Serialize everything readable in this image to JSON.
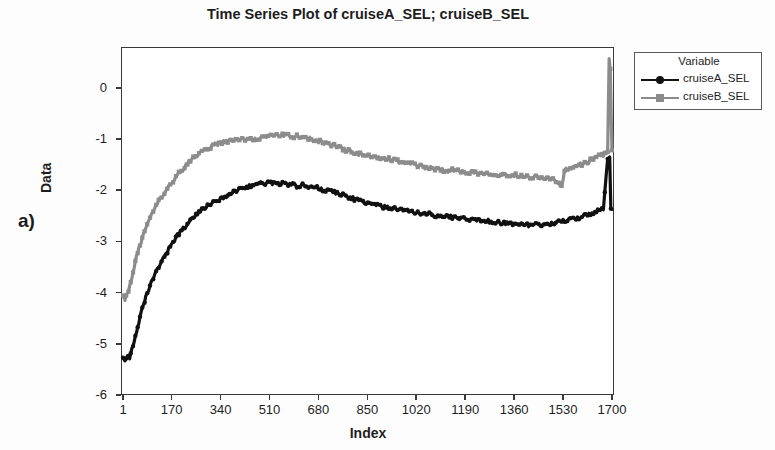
{
  "figure": {
    "panel_label": "a)"
  },
  "chart_data": {
    "type": "line",
    "title": "Time Series Plot of cruiseA_SEL; cruiseB_SEL",
    "xlabel": "Index",
    "ylabel": "Data",
    "xlim": [
      1,
      1700
    ],
    "ylim": [
      -6,
      0.8
    ],
    "grid": false,
    "legend_position": "right-outside",
    "legend_title": "Variable",
    "xticks": [
      1,
      170,
      340,
      510,
      680,
      850,
      1020,
      1190,
      1360,
      1530,
      1700
    ],
    "xtick_labels": [
      "1",
      "170",
      "340",
      "510",
      "680",
      "850",
      "1020",
      "1190",
      "1360",
      "1530",
      "1700"
    ],
    "yticks": [
      0,
      -1,
      -2,
      -3,
      -4,
      -5,
      -6
    ],
    "ytick_labels": [
      "0",
      "-1",
      "-2",
      "-3",
      "-4",
      "-5",
      "-6"
    ],
    "series": [
      {
        "name": "cruiseA_SEL",
        "color": "#111111",
        "marker": "circle",
        "x": [
          1,
          8,
          16,
          24,
          32,
          40,
          48,
          56,
          64,
          72,
          80,
          90,
          100,
          112,
          125,
          140,
          155,
          170,
          190,
          210,
          230,
          250,
          270,
          290,
          310,
          330,
          350,
          370,
          390,
          410,
          430,
          450,
          470,
          490,
          510,
          530,
          550,
          570,
          590,
          610,
          630,
          650,
          670,
          690,
          710,
          730,
          750,
          770,
          790,
          810,
          830,
          850,
          870,
          890,
          910,
          930,
          950,
          970,
          990,
          1010,
          1030,
          1050,
          1070,
          1090,
          1110,
          1130,
          1150,
          1170,
          1190,
          1210,
          1230,
          1250,
          1270,
          1290,
          1310,
          1330,
          1350,
          1370,
          1390,
          1410,
          1430,
          1450,
          1470,
          1490,
          1510,
          1530,
          1550,
          1570,
          1590,
          1610,
          1630,
          1650,
          1670,
          1685,
          1692,
          1696,
          1700
        ],
        "y": [
          -5.25,
          -5.3,
          -5.22,
          -5.26,
          -5.1,
          -4.95,
          -4.8,
          -4.6,
          -4.4,
          -4.25,
          -4.1,
          -3.95,
          -3.8,
          -3.65,
          -3.5,
          -3.35,
          -3.2,
          -3.05,
          -2.88,
          -2.75,
          -2.62,
          -2.5,
          -2.4,
          -2.33,
          -2.26,
          -2.2,
          -2.14,
          -2.08,
          -2.02,
          -1.97,
          -1.93,
          -1.9,
          -1.87,
          -1.86,
          -1.85,
          -1.87,
          -1.86,
          -1.9,
          -1.88,
          -1.92,
          -1.9,
          -1.95,
          -1.94,
          -1.98,
          -2.0,
          -2.03,
          -2.06,
          -2.1,
          -2.14,
          -2.18,
          -2.22,
          -2.26,
          -2.28,
          -2.3,
          -2.33,
          -2.34,
          -2.36,
          -2.38,
          -2.4,
          -2.42,
          -2.45,
          -2.44,
          -2.47,
          -2.5,
          -2.52,
          -2.5,
          -2.53,
          -2.55,
          -2.54,
          -2.57,
          -2.58,
          -2.6,
          -2.59,
          -2.62,
          -2.63,
          -2.64,
          -2.65,
          -2.66,
          -2.67,
          -2.68,
          -2.68,
          -2.67,
          -2.66,
          -2.65,
          -2.63,
          -2.6,
          -2.58,
          -2.55,
          -2.52,
          -2.48,
          -2.44,
          -2.4,
          -2.38,
          -1.35,
          -1.35,
          -2.38,
          -2.37
        ]
      },
      {
        "name": "cruiseB_SEL",
        "color": "#8c8c8c",
        "marker": "square",
        "x": [
          1,
          8,
          16,
          24,
          32,
          40,
          48,
          56,
          64,
          72,
          80,
          90,
          100,
          112,
          125,
          140,
          155,
          170,
          190,
          210,
          230,
          250,
          270,
          290,
          310,
          330,
          350,
          370,
          390,
          410,
          430,
          450,
          470,
          490,
          510,
          530,
          550,
          570,
          590,
          610,
          630,
          650,
          670,
          690,
          710,
          730,
          750,
          770,
          790,
          810,
          830,
          850,
          870,
          890,
          910,
          930,
          950,
          970,
          990,
          1010,
          1030,
          1050,
          1070,
          1090,
          1110,
          1130,
          1150,
          1170,
          1190,
          1210,
          1230,
          1250,
          1270,
          1290,
          1310,
          1330,
          1350,
          1370,
          1390,
          1410,
          1430,
          1450,
          1470,
          1490,
          1510,
          1525,
          1535,
          1550,
          1570,
          1590,
          1610,
          1630,
          1650,
          1670,
          1685,
          1690,
          1694,
          1697,
          1700
        ],
        "y": [
          -4.05,
          -4.15,
          -4.0,
          -3.9,
          -3.7,
          -3.5,
          -3.3,
          -3.15,
          -3.0,
          -2.85,
          -2.72,
          -2.6,
          -2.48,
          -2.35,
          -2.22,
          -2.1,
          -1.98,
          -1.86,
          -1.7,
          -1.58,
          -1.45,
          -1.35,
          -1.26,
          -1.2,
          -1.14,
          -1.1,
          -1.06,
          -1.04,
          -1.02,
          -1.0,
          -1.0,
          -1.0,
          -0.98,
          -0.96,
          -0.95,
          -0.93,
          -0.92,
          -0.93,
          -0.95,
          -0.94,
          -0.97,
          -1.0,
          -1.03,
          -1.05,
          -1.08,
          -1.12,
          -1.15,
          -1.2,
          -1.24,
          -1.28,
          -1.3,
          -1.32,
          -1.35,
          -1.38,
          -1.36,
          -1.4,
          -1.42,
          -1.45,
          -1.47,
          -1.5,
          -1.52,
          -1.55,
          -1.57,
          -1.58,
          -1.6,
          -1.62,
          -1.6,
          -1.63,
          -1.65,
          -1.64,
          -1.66,
          -1.67,
          -1.65,
          -1.68,
          -1.7,
          -1.69,
          -1.71,
          -1.7,
          -1.72,
          -1.74,
          -1.73,
          -1.75,
          -1.76,
          -1.78,
          -1.82,
          -1.95,
          -1.62,
          -1.58,
          -1.55,
          -1.5,
          -1.45,
          -1.4,
          -1.35,
          -1.3,
          -1.25,
          0.55,
          0.35,
          -0.52,
          -1.22
        ]
      }
    ],
    "annotations": [
      {
        "text": "spike at right end near Index 1700",
        "series": "cruiseB_SEL"
      }
    ]
  }
}
